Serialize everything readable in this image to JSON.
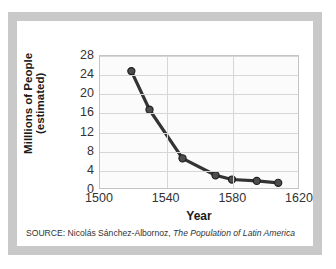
{
  "figure": {
    "y_axis_title_line1": "Milllions of People",
    "y_axis_title_line2": "(estimated)",
    "x_axis_title": "Year",
    "source_prefix": "SOURCE: Nicolás Sánchez-Albornoz, ",
    "source_title": "The Population of Latin America",
    "colors": {
      "frame": "#c9c9c9",
      "panel": "#ffffff",
      "plot_background": "#fbfbfb",
      "gridline": "#d6d6d6",
      "axis_border": "#c4c4c4",
      "series": "#333333",
      "marker_fill": "#4d4d4d",
      "text": "#333333",
      "title_text": "#1a1a1a"
    }
  },
  "chart_data": {
    "type": "line",
    "title": "",
    "xlabel": "Year",
    "ylabel": "Milllions of People (estimated)",
    "xlim": [
      1500,
      1620
    ],
    "ylim": [
      0,
      28
    ],
    "xticks": [
      1500,
      1540,
      1580,
      1620
    ],
    "yticks": [
      0,
      4,
      8,
      12,
      16,
      20,
      24,
      28
    ],
    "grid": true,
    "legend": "none",
    "x": [
      1519,
      1530,
      1550,
      1570,
      1580,
      1595,
      1608
    ],
    "values": [
      24.8,
      16.6,
      6.3,
      2.7,
      1.8,
      1.5,
      1.1
    ],
    "points": [
      {
        "year": 1519,
        "population_millions": 24.8
      },
      {
        "year": 1530,
        "population_millions": 16.6
      },
      {
        "year": 1550,
        "population_millions": 6.3
      },
      {
        "year": 1570,
        "population_millions": 2.7
      },
      {
        "year": 1580,
        "population_millions": 1.8
      },
      {
        "year": 1595,
        "population_millions": 1.5
      },
      {
        "year": 1608,
        "population_millions": 1.1
      }
    ]
  }
}
